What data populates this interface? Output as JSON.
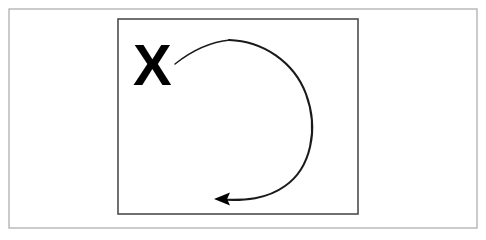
{
  "figure": {
    "title": "",
    "background_color": "#ffffff",
    "outer_frame": {
      "name": "outer-frame",
      "x": 9,
      "y": 9,
      "width": 468,
      "height": 219,
      "stroke_color": "#a8a8a8",
      "stroke_width": 1.2,
      "fill_color": "#ffffff"
    },
    "inner_rectangle": {
      "name": "inner-rectangle",
      "x": 118,
      "y": 19,
      "width": 240,
      "height": 195,
      "stroke_color": "#4d4d4d",
      "stroke_width": 1.6,
      "fill_color": "#ffffff"
    },
    "x_marker": {
      "name": "x-marker",
      "label": "X",
      "color": "#000000",
      "x": 133,
      "y": 85,
      "font_size": 58,
      "bold": true
    },
    "arrow": {
      "name": "clockwise-arrow",
      "direction": "clockwise",
      "color": "#1a1a1a",
      "stroke_width": 2.1,
      "start_point": [
        175,
        64
      ],
      "apex_point": [
        228,
        40
      ],
      "right_extent_point": [
        310,
        120
      ],
      "end_point": [
        214,
        199
      ],
      "arrowhead": {
        "name": "arrowhead",
        "tip": [
          214,
          199
        ],
        "points_toward": "left",
        "fill_color": "#000000",
        "length": 16,
        "half_width": 6.5
      }
    }
  }
}
